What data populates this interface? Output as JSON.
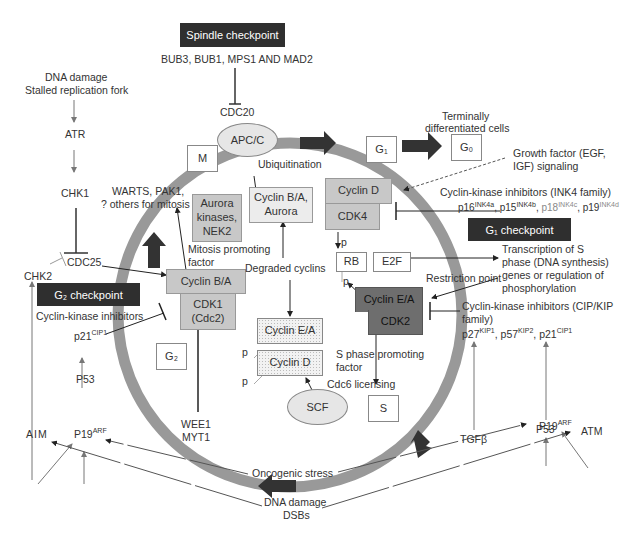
{
  "checkpoints": {
    "spindle": "Spindle  checkpoint",
    "g1": "G₁ checkpoint",
    "g2": "G₂ checkpoint"
  },
  "phases": {
    "m": "M",
    "g1": "G₁",
    "g0": "G₀",
    "g2": "G₂",
    "s": "S"
  },
  "complexes": {
    "apc": "APC/C",
    "scf": "SCF",
    "cyclin_ba_aurora": "Cyclin B/A, Aurora",
    "aurora_nek2": "Aurora kinases, NEK2",
    "cyclin_d": "Cyclin D",
    "cdk4": "CDK4",
    "rb": "RB",
    "e2f": "E2F",
    "cyclin_ea": "Cyclin E/A",
    "cdk2": "CDK2",
    "cyclin_ba": "Cyclin B/A",
    "cdk1": "CDK1 (Cdc2)",
    "deg_cyclin_ea": "Cyclin E/A",
    "deg_cyclin_d": "Cyclin D"
  },
  "labels": {
    "bub": "BUB3, BUB1, MPS1 AND MAD2",
    "cdc20": "CDC20",
    "dna_damage_1": "DNA damage",
    "stalled": "Stalled replication fork",
    "atr": "ATR",
    "chk1": "CHK1",
    "cdc25": "CDC25",
    "chk2": "CHK2",
    "warts_1": "WARTS, PAK1,",
    "warts_2": "? others for mitosis",
    "mpf_1": "Mitosis promoting",
    "mpf_2": "factor",
    "ubiquitination": "Ubiquitination",
    "terminally_1": "Terminally",
    "terminally_2": "differentiated cells",
    "growth_1": "Growth factor (EGF,",
    "growth_2": "IGF) signaling",
    "ink4_title": "Cyclin-kinase inhibitors (INK4 family)",
    "degraded": "Degraded cyclins",
    "transcription_1": "Transcription of S",
    "transcription_2": "phase (DNA synthesis)",
    "transcription_3": "genes or regulation of",
    "transcription_4": "phosphorylation",
    "restriction": "Restriction point",
    "cip_1": "Cyclin-kinase inhibitors (CIP/KIP",
    "cip_2": "family)",
    "cki_left": "Cyclin-kinase inhibitors",
    "p21_left": "p21",
    "p21_left_sup": "CIP1",
    "spf_1": "S phase promoting",
    "spf_2": "factor",
    "cdc6": "Cdc6 licensing",
    "tgfb": "TGFβ",
    "p53_left": "P53",
    "p53_right": "P53",
    "aim": "AIM",
    "p19_left": "P19",
    "p19_left_sup": "ARF",
    "p19_right": "P19",
    "p19_right_sup": "ARF",
    "atm": "ATM",
    "wee1": "WEE1",
    "myt1": "MYT1",
    "oncogenic": "Oncogenic stress",
    "dna_damage_2": "DNA damage",
    "dsbs": "DSBs",
    "p": "p"
  },
  "ink4": [
    "p16",
    "INK4a",
    "p15",
    "INK4b",
    "p18",
    "INK4c",
    "p19",
    "INK4d"
  ],
  "cip": [
    "p27",
    "KIP1",
    "p57",
    "KIP2",
    "p21",
    "CIP1"
  ]
}
